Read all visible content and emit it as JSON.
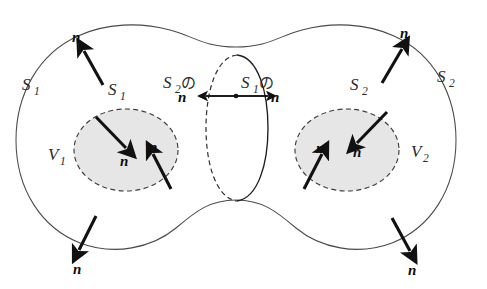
{
  "figure": {
    "background_color": "#ffffff",
    "width": 487,
    "height": 289
  },
  "colors": {
    "outline": "#4a4a4a",
    "dashed": "#3d3d3d",
    "inner_fill": "#e6e6e6",
    "vector": "#111111",
    "label": "#2b2b2b"
  },
  "labels": {
    "normal": "n",
    "surface_1": "S",
    "surface_1_sub": "1",
    "surface_2": "S",
    "surface_2_sub": "2",
    "volume_1": "V",
    "volume_1_sub": "1",
    "volume_2": "V",
    "volume_2_sub": "2",
    "particle_no": "の"
  },
  "annotations": [
    {
      "id": "outer-s1-left",
      "kind": "surface-label",
      "text": "S",
      "sub": "1",
      "x": 26,
      "y": 88,
      "description": "outer surface S1 label on left lobe boundary"
    },
    {
      "id": "outer-s2-right",
      "kind": "surface-label",
      "text": "S",
      "sub": "2",
      "x": 432,
      "y": 78,
      "description": "outer surface S2 label on right lobe boundary"
    },
    {
      "id": "inner-s1",
      "kind": "surface-label",
      "text": "S",
      "sub": "1",
      "x": 110,
      "y": 93,
      "description": "inner dashed surface S1 label above left inner region"
    },
    {
      "id": "inner-s2",
      "kind": "surface-label",
      "text": "S",
      "sub": "2",
      "x": 348,
      "y": 88,
      "description": "inner dashed surface S2 label above right inner region"
    },
    {
      "id": "vol-v1",
      "kind": "volume-label",
      "text": "V",
      "sub": "1",
      "x": 50,
      "y": 160,
      "description": "volume V1 label in left lobe"
    },
    {
      "id": "vol-v2",
      "kind": "volume-label",
      "text": "V",
      "sub": "2",
      "x": 412,
      "y": 156,
      "description": "volume V2 label in right lobe"
    },
    {
      "id": "interface-left",
      "kind": "interface-label",
      "text": "S",
      "sub": "2",
      "particle": "の",
      "normal": "n",
      "x": 166,
      "y": 86,
      "description": "S2 no n — normal of surface S2 at the interface, pointing left"
    },
    {
      "id": "interface-right",
      "kind": "interface-label",
      "text": "S",
      "sub": "1",
      "particle": "の",
      "normal": "n",
      "x": 243,
      "y": 86,
      "description": "S1 no n — normal of surface S1 at the interface, pointing right"
    }
  ],
  "normal_vectors": [
    {
      "id": "n-outer-top-left",
      "label": "n",
      "label_x": 76,
      "label_y": 38,
      "direction": "up-left-outward",
      "surface": "S1 outer",
      "x1": 103,
      "y1": 85,
      "x2": 83,
      "y2": 50
    },
    {
      "id": "n-outer-top-right",
      "label": "n",
      "label_x": 404,
      "label_y": 34,
      "direction": "up-right-outward",
      "surface": "S2 outer",
      "x1": 382,
      "y1": 82,
      "x2": 403,
      "y2": 48
    },
    {
      "id": "n-outer-bottom-left",
      "label": "n",
      "label_x": 78,
      "label_y": 271,
      "direction": "down-left-outward",
      "surface": "S1 outer",
      "x1": 96,
      "y1": 216,
      "x2": 78,
      "y2": 252
    },
    {
      "id": "n-outer-bottom-right",
      "label": "n",
      "label_x": 412,
      "label_y": 272,
      "direction": "down-right-outward",
      "surface": "S2 outer",
      "x1": 392,
      "y1": 218,
      "x2": 411,
      "y2": 253
    },
    {
      "id": "n-inner-left-upper",
      "label": "n",
      "label_x": 126,
      "label_y": 163,
      "direction": "down-right-inward",
      "surface": "S1 inner",
      "x1": 96,
      "y1": 117,
      "x2": 127,
      "y2": 149
    },
    {
      "id": "n-inner-left-lower",
      "label": "n",
      "label_x": 155,
      "label_y": 150,
      "direction": "up-left-inward",
      "surface": "S1 inner",
      "x1": 170,
      "y1": 188,
      "x2": 152,
      "y2": 152
    },
    {
      "id": "n-inner-right-upper",
      "label": "n",
      "label_x": 357,
      "label_y": 154,
      "direction": "down-left-inward",
      "surface": "S2 inner",
      "x1": 386,
      "y1": 112,
      "x2": 356,
      "y2": 144
    },
    {
      "id": "n-inner-right-lower",
      "label": "n",
      "label_x": 320,
      "label_y": 150,
      "direction": "up-right-inward",
      "surface": "S2 inner",
      "x1": 305,
      "y1": 188,
      "x2": 322,
      "y2": 152
    }
  ],
  "interface_axis": {
    "description": "double-headed horizontal arrow across the common interface with a point marker at the centre",
    "left_tip_x": 203,
    "right_tip_x": 268,
    "y": 96,
    "dot_x": 236
  }
}
